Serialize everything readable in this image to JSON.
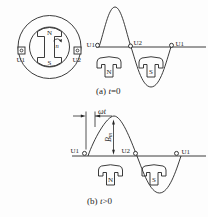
{
  "machine": {
    "rotor_n": "N",
    "rotor_s": "S",
    "speed_label": "n",
    "terminal_left": "U1",
    "terminal_right": "U2"
  },
  "panel_a": {
    "point_left": "U1",
    "point_mid": "U2",
    "point_right": "U1",
    "pole_n": "N",
    "pole_s": "S",
    "caption_prefix": "(a)",
    "caption_var": "t",
    "caption_rest": "=0"
  },
  "panel_b": {
    "point_left": "U1",
    "point_mid": "U2",
    "point_right": "U1",
    "pole_n": "N",
    "pole_s": "S",
    "phase_label": "ωt",
    "amplitude_main": "B",
    "amplitude_sub": "m",
    "caption_prefix": "(b)",
    "caption_var": "t",
    "caption_rest": ">0"
  },
  "colors": {
    "ink": "#262626",
    "background": "#fdfdfd"
  }
}
